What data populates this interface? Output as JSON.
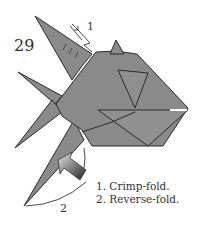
{
  "diagram": {
    "step_number": "29",
    "arrow_labels": [
      "1",
      "2"
    ],
    "instructions": [
      "1. Crimp-fold.",
      "2. Reverse-fold."
    ],
    "colors": {
      "paper": "#8a8a8a",
      "paper_light": "#9a9a9a",
      "outline": "#2a2a2a",
      "background": "#ffffff"
    }
  }
}
